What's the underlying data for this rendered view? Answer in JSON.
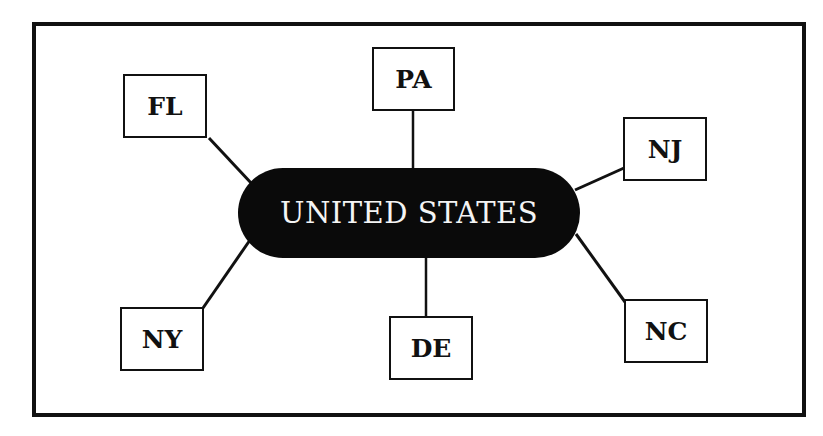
{
  "diagram": {
    "type": "hub-and-spoke",
    "hub": {
      "label": "UNITED STATES",
      "fill": "#0a0a0a",
      "text_color": "#f4f4f4"
    },
    "nodes": [
      {
        "id": "FL",
        "label": "FL"
      },
      {
        "id": "PA",
        "label": "PA"
      },
      {
        "id": "NJ",
        "label": "NJ"
      },
      {
        "id": "NY",
        "label": "NY"
      },
      {
        "id": "DE",
        "label": "DE"
      },
      {
        "id": "NC",
        "label": "NC"
      }
    ],
    "edges": [
      {
        "from": "UNITED STATES",
        "to": "FL"
      },
      {
        "from": "UNITED STATES",
        "to": "PA"
      },
      {
        "from": "UNITED STATES",
        "to": "NJ"
      },
      {
        "from": "UNITED STATES",
        "to": "NY"
      },
      {
        "from": "UNITED STATES",
        "to": "DE"
      },
      {
        "from": "UNITED STATES",
        "to": "NC"
      }
    ],
    "colors": {
      "stroke": "#111111",
      "background": "#ffffff"
    }
  }
}
